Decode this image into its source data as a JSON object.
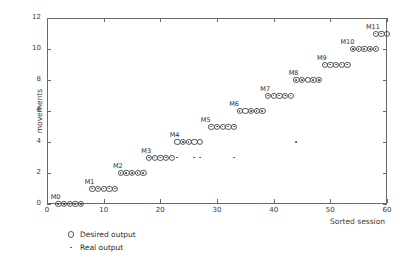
{
  "chart_data": {
    "type": "scatter",
    "title": "",
    "xlabel": "Sorted session",
    "ylabel": "movements",
    "xlim": [
      0,
      60
    ],
    "ylim": [
      0,
      12
    ],
    "xticks": [
      0,
      10,
      20,
      30,
      40,
      50,
      60
    ],
    "yticks": [
      0,
      2,
      4,
      6,
      8,
      10,
      12
    ],
    "grid": false,
    "legend_position": "below-left",
    "legend": [
      {
        "key": "desired",
        "marker": "open-circle",
        "label": "Desired output"
      },
      {
        "key": "real",
        "marker": "dot",
        "label": "Real output"
      }
    ],
    "annotations": [
      {
        "text": "M0",
        "x": 1.5,
        "y": 0
      },
      {
        "text": "M1",
        "x": 7.5,
        "y": 1
      },
      {
        "text": "M2",
        "x": 12.5,
        "y": 2
      },
      {
        "text": "M3",
        "x": 17.5,
        "y": 3
      },
      {
        "text": "M4",
        "x": 22.5,
        "y": 4
      },
      {
        "text": "M5",
        "x": 28.0,
        "y": 5
      },
      {
        "text": "M6",
        "x": 33.0,
        "y": 6
      },
      {
        "text": "M7",
        "x": 38.5,
        "y": 7
      },
      {
        "text": "M8",
        "x": 43.5,
        "y": 8
      },
      {
        "text": "M9",
        "x": 48.5,
        "y": 9
      },
      {
        "text": "M10",
        "x": 53.0,
        "y": 10
      },
      {
        "text": "M11",
        "x": 57.5,
        "y": 11
      }
    ],
    "series": [
      {
        "name": "Desired output",
        "marker": "open-circle",
        "points": [
          [
            2,
            0
          ],
          [
            3,
            0
          ],
          [
            4,
            0
          ],
          [
            5,
            0
          ],
          [
            6,
            0
          ],
          [
            8,
            1
          ],
          [
            9,
            1
          ],
          [
            10,
            1
          ],
          [
            11,
            1
          ],
          [
            12,
            1
          ],
          [
            13,
            2
          ],
          [
            14,
            2
          ],
          [
            15,
            2
          ],
          [
            16,
            2
          ],
          [
            17,
            2
          ],
          [
            18,
            3
          ],
          [
            19,
            3
          ],
          [
            20,
            3
          ],
          [
            21,
            3
          ],
          [
            22,
            3
          ],
          [
            23,
            4
          ],
          [
            24,
            4
          ],
          [
            25,
            4
          ],
          [
            26,
            4
          ],
          [
            27,
            4
          ],
          [
            29,
            5
          ],
          [
            30,
            5
          ],
          [
            31,
            5
          ],
          [
            32,
            5
          ],
          [
            33,
            5
          ],
          [
            34,
            6
          ],
          [
            35,
            6
          ],
          [
            36,
            6
          ],
          [
            37,
            6
          ],
          [
            38,
            6
          ],
          [
            39,
            7
          ],
          [
            40,
            7
          ],
          [
            41,
            7
          ],
          [
            42,
            7
          ],
          [
            43,
            7
          ],
          [
            44,
            8
          ],
          [
            45,
            8
          ],
          [
            46,
            8
          ],
          [
            47,
            8
          ],
          [
            48,
            8
          ],
          [
            49,
            9
          ],
          [
            50,
            9
          ],
          [
            51,
            9
          ],
          [
            52,
            9
          ],
          [
            53,
            9
          ],
          [
            54,
            10
          ],
          [
            55,
            10
          ],
          [
            56,
            10
          ],
          [
            57,
            10
          ],
          [
            58,
            10
          ],
          [
            58,
            11
          ],
          [
            59,
            11
          ],
          [
            60,
            11
          ]
        ]
      },
      {
        "name": "Real output",
        "marker": "dot",
        "points": [
          [
            2,
            0
          ],
          [
            3,
            0
          ],
          [
            4,
            0
          ],
          [
            5,
            0
          ],
          [
            6,
            0
          ],
          [
            8,
            1
          ],
          [
            9,
            1
          ],
          [
            10,
            1
          ],
          [
            11,
            1
          ],
          [
            12,
            1
          ],
          [
            13,
            2
          ],
          [
            14,
            2
          ],
          [
            15,
            2
          ],
          [
            16,
            2
          ],
          [
            17,
            2
          ],
          [
            18,
            3
          ],
          [
            19,
            3
          ],
          [
            20,
            3
          ],
          [
            21,
            3
          ],
          [
            22,
            3
          ],
          [
            23,
            3
          ],
          [
            26,
            3
          ],
          [
            27,
            3
          ],
          [
            33,
            3
          ],
          [
            24,
            4
          ],
          [
            25,
            4
          ],
          [
            44,
            4
          ],
          [
            29,
            5
          ],
          [
            30,
            5
          ],
          [
            31,
            5
          ],
          [
            32,
            5
          ],
          [
            33,
            5
          ],
          [
            34,
            6
          ],
          [
            36,
            6
          ],
          [
            37,
            6
          ],
          [
            38,
            6
          ],
          [
            39,
            7
          ],
          [
            40,
            7
          ],
          [
            41,
            7
          ],
          [
            42,
            7
          ],
          [
            43,
            7
          ],
          [
            44,
            8
          ],
          [
            45,
            8
          ],
          [
            47,
            8
          ],
          [
            48,
            8
          ],
          [
            49,
            9
          ],
          [
            50,
            9
          ],
          [
            51,
            9
          ],
          [
            52,
            9
          ],
          [
            53,
            9
          ],
          [
            54,
            10
          ],
          [
            55,
            10
          ],
          [
            56,
            10
          ],
          [
            57,
            10
          ],
          [
            58,
            10
          ],
          [
            58,
            11
          ],
          [
            59,
            11
          ]
        ]
      }
    ]
  }
}
